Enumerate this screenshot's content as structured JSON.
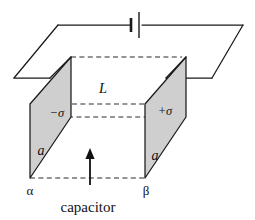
{
  "figure": {
    "caption": "capacitor",
    "colors": {
      "plate_fill": "#cfcfcf",
      "line": "#1a1a1a",
      "dashed": "#2a2a2a",
      "background": "#ffffff"
    },
    "labels": {
      "left_plate_charge": "−σ",
      "right_plate_charge": "+σ",
      "separation": "L",
      "plate_side_left": "a",
      "plate_side_right": "a",
      "point_left": "α",
      "point_right": "β"
    },
    "components": {
      "battery_name": "battery-symbol",
      "left_plate_name": "negative-plate",
      "right_plate_name": "positive-plate",
      "wire_loop_name": "circuit-wire-loop",
      "arrow_name": "capacitor-pointer-arrow"
    }
  }
}
